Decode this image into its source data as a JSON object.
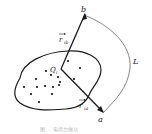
{
  "diagram": {
    "labels": {
      "b": "b",
      "a": "a",
      "L": "L",
      "Q": "Q",
      "Q_sub": "i",
      "r_ib": "r",
      "r_ib_sub": "ib",
      "r_ia": "r",
      "r_ia_sub": "ia"
    },
    "caption": "图 … 电场力做功",
    "colors": {
      "stroke": "#1a1a1a",
      "path_L": "#666666",
      "dots": "#111111"
    },
    "charges": [
      [
        46,
        71
      ],
      [
        36,
        79
      ],
      [
        51,
        75
      ],
      [
        58,
        76
      ],
      [
        37,
        87
      ],
      [
        44,
        86
      ],
      [
        53,
        86
      ],
      [
        60,
        83
      ],
      [
        59,
        84
      ],
      [
        24,
        87
      ],
      [
        31,
        94
      ],
      [
        51,
        94
      ],
      [
        38,
        101
      ],
      [
        68,
        60
      ],
      [
        80,
        67
      ],
      [
        73,
        79
      ]
    ]
  }
}
